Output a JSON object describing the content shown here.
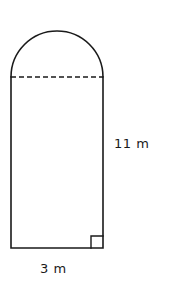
{
  "figure": {
    "stroke_color": "#1a1a1a",
    "fill_color": "#ffffff",
    "background_color": "#ffffff",
    "labels": {
      "height": "11 m",
      "width": "3 m"
    },
    "markers": {
      "right_angle": "right-angle-square"
    },
    "geometry": {
      "left_x": 11,
      "right_x": 103,
      "bottom_y": 248,
      "chord_y": 77,
      "arc_apex_y": 31,
      "arc_radius_x": 46,
      "arc_radius_y": 46,
      "right_angle_size": 12,
      "dash_pattern": "5 3"
    }
  }
}
